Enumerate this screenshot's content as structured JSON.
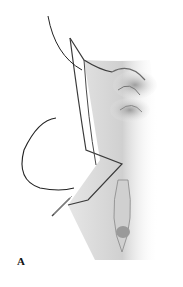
{
  "figure": {
    "panel_label": "A",
    "colors": {
      "line": "#2a2a2a",
      "tissue_shadow": "#9a9a9a",
      "tissue_light": "#d8d8d8",
      "background": "#ffffff"
    }
  }
}
